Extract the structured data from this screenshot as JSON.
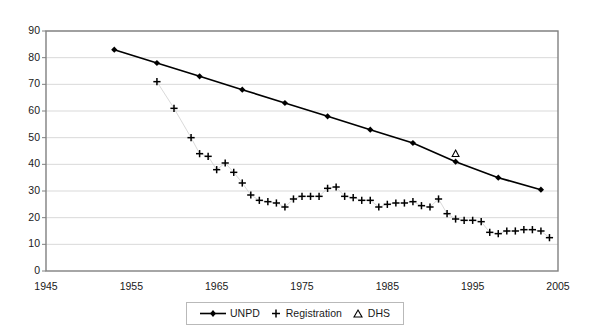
{
  "chart_data": {
    "type": "line",
    "title": "",
    "subtitle": "",
    "xlabel": "",
    "ylabel": "",
    "xlim": [
      1945,
      2005
    ],
    "ylim": [
      0,
      90
    ],
    "x_ticks": [
      1945,
      1955,
      1965,
      1975,
      1985,
      1995,
      2005
    ],
    "y_ticks": [
      0,
      10,
      20,
      30,
      40,
      50,
      60,
      70,
      80,
      90
    ],
    "grid": "horizontal",
    "legend_position": "bottom",
    "series": [
      {
        "name": "UNPD",
        "marker": "diamond",
        "line": true,
        "points": [
          {
            "x": 1953,
            "y": 83.0
          },
          {
            "x": 1958,
            "y": 78.0
          },
          {
            "x": 1963,
            "y": 73.0
          },
          {
            "x": 1968,
            "y": 68.0
          },
          {
            "x": 1973,
            "y": 63.0
          },
          {
            "x": 1978,
            "y": 58.0
          },
          {
            "x": 1983,
            "y": 53.0
          },
          {
            "x": 1988,
            "y": 48.0
          },
          {
            "x": 1993,
            "y": 41.0
          },
          {
            "x": 1998,
            "y": 35.0
          },
          {
            "x": 2003,
            "y": 30.5
          }
        ]
      },
      {
        "name": "Registration",
        "marker": "plus",
        "line": false,
        "points": [
          {
            "x": 1958,
            "y": 71.0
          },
          {
            "x": 1960,
            "y": 61.0
          },
          {
            "x": 1962,
            "y": 50.0
          },
          {
            "x": 1963,
            "y": 44.0
          },
          {
            "x": 1964,
            "y": 43.0
          },
          {
            "x": 1965,
            "y": 38.0
          },
          {
            "x": 1966,
            "y": 40.5
          },
          {
            "x": 1967,
            "y": 37.0
          },
          {
            "x": 1968,
            "y": 33.0
          },
          {
            "x": 1969,
            "y": 28.5
          },
          {
            "x": 1970,
            "y": 26.5
          },
          {
            "x": 1971,
            "y": 26.0
          },
          {
            "x": 1972,
            "y": 25.5
          },
          {
            "x": 1973,
            "y": 24.0
          },
          {
            "x": 1974,
            "y": 27.0
          },
          {
            "x": 1975,
            "y": 28.0
          },
          {
            "x": 1976,
            "y": 28.0
          },
          {
            "x": 1977,
            "y": 28.0
          },
          {
            "x": 1978,
            "y": 31.0
          },
          {
            "x": 1979,
            "y": 31.5
          },
          {
            "x": 1980,
            "y": 28.0
          },
          {
            "x": 1981,
            "y": 27.5
          },
          {
            "x": 1982,
            "y": 26.5
          },
          {
            "x": 1983,
            "y": 26.5
          },
          {
            "x": 1984,
            "y": 24.0
          },
          {
            "x": 1985,
            "y": 25.0
          },
          {
            "x": 1986,
            "y": 25.5
          },
          {
            "x": 1987,
            "y": 25.5
          },
          {
            "x": 1988,
            "y": 26.0
          },
          {
            "x": 1989,
            "y": 24.5
          },
          {
            "x": 1990,
            "y": 24.0
          },
          {
            "x": 1991,
            "y": 27.0
          },
          {
            "x": 1992,
            "y": 21.5
          },
          {
            "x": 1993,
            "y": 19.5
          },
          {
            "x": 1994,
            "y": 19.0
          },
          {
            "x": 1995,
            "y": 19.0
          },
          {
            "x": 1996,
            "y": 18.5
          },
          {
            "x": 1997,
            "y": 14.5
          },
          {
            "x": 1998,
            "y": 14.0
          },
          {
            "x": 1999,
            "y": 15.0
          },
          {
            "x": 2000,
            "y": 15.0
          },
          {
            "x": 2001,
            "y": 15.5
          },
          {
            "x": 2002,
            "y": 15.5
          },
          {
            "x": 2003,
            "y": 15.0
          },
          {
            "x": 2004,
            "y": 12.5
          }
        ]
      },
      {
        "name": "DHS",
        "marker": "triangle",
        "line": false,
        "points": [
          {
            "x": 1993,
            "y": 44.0
          }
        ]
      }
    ]
  },
  "legend": {
    "items": [
      {
        "label": "UNPD",
        "marker": "line-diamond"
      },
      {
        "label": "Registration",
        "marker": "plus"
      },
      {
        "label": "DHS",
        "marker": "triangle"
      }
    ]
  },
  "colors": {
    "plot_border": "#808080",
    "gridline": "#d9d9d9",
    "series_unpd": "#000000",
    "series_registration": "#000000",
    "series_dhs": "#000000",
    "background": "#ffffff",
    "text": "#1a1a1a"
  }
}
